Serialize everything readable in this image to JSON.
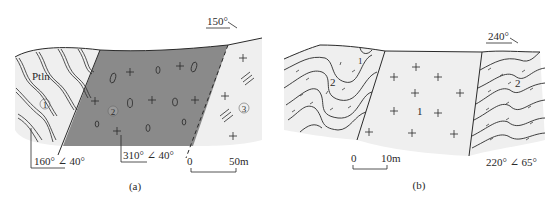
{
  "panel_a": {
    "caption": "(a)",
    "direction": "150°",
    "unit_label": "Ptln",
    "units": [
      {
        "id": "1",
        "symbol": "①",
        "description": "folded foliated strata (wavy double lines)"
      },
      {
        "id": "2",
        "symbol": "②",
        "description": "dark grey body with + and pebble/ellipse symbols"
      },
      {
        "id": "3",
        "symbol": "③",
        "description": "light body with + and triple-dash symbols"
      }
    ],
    "attitude_left": "160° ∠ 40°",
    "attitude_middle": "310° ∠ 40°",
    "scale": {
      "start": "0",
      "end": "50m"
    }
  },
  "panel_b": {
    "caption": "(b)",
    "direction": "240°",
    "units": [
      {
        "id": "1",
        "label": "1",
        "description": "central granite-like body with + symbols"
      },
      {
        "id": "2",
        "label": "2",
        "description": "folded strata with dashes"
      }
    ],
    "small_label_1": "1",
    "left_label_2": "2",
    "right_label_2": "2",
    "center_label_1": "1",
    "attitude_right": "220° ∠ 65°",
    "scale": {
      "start": "0",
      "end": "10m"
    }
  },
  "colors": {
    "dark_fill": "#8a8a8a",
    "light_fill": "#efefef",
    "line": "#2a2a2a",
    "background": "#ffffff"
  }
}
